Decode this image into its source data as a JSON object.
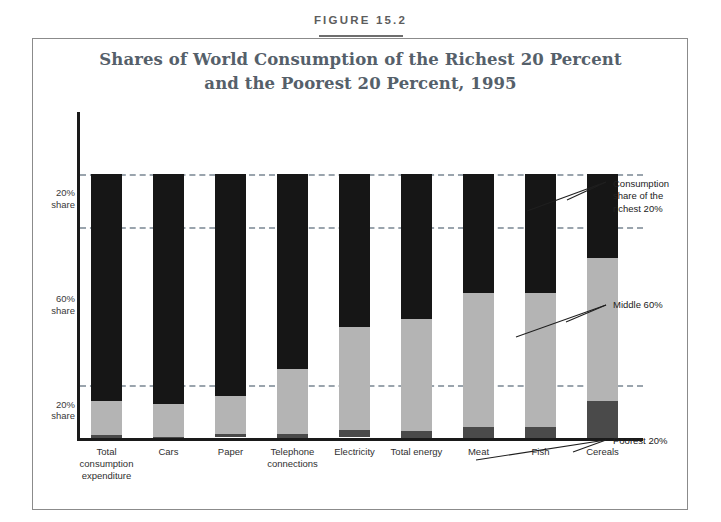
{
  "figure": {
    "number": "FIGURE 15.2",
    "title_line1": "Shares of World Consumption of the Richest 20 Percent",
    "title_line2": "and the Poorest 20 Percent, 1995"
  },
  "axis": {
    "y_labels": [
      {
        "pct": "20%",
        "word": "share"
      },
      {
        "pct": "60%",
        "word": "share"
      },
      {
        "pct": "20%",
        "word": "share"
      }
    ]
  },
  "callouts": {
    "richest": "Consumption share of the richest 20%",
    "middle": "Middle 60%",
    "poorest": "Poorest 20%"
  },
  "colors": {
    "richest": "#161616",
    "middle": "#b4b4b4",
    "poorest": "#4a4a4a",
    "title": "#55606a",
    "figure_number": "#5d5d5d",
    "gridline": "#9aa4ad",
    "axis": "#1a1a1a",
    "frame": "#8b8b8b"
  },
  "chart_data": {
    "type": "bar",
    "title": "Shares of World Consumption of the Richest 20 Percent and the Poorest 20 Percent, 1995",
    "xlabel": "",
    "ylabel": "Share of world consumption (%)",
    "ylim": [
      0,
      100
    ],
    "grid": true,
    "stacked": true,
    "legend_position": "annotations-right",
    "categories": [
      "Total consumption expenditure",
      "Cars",
      "Paper",
      "Telephone connections",
      "Electricity",
      "Total energy",
      "Meat",
      "Fish",
      "Cereals"
    ],
    "category_label_lines": [
      [
        "Total",
        "consumption",
        "expenditure"
      ],
      [
        "Cars"
      ],
      [
        "Paper"
      ],
      [
        "Telephone",
        "connections"
      ],
      [
        "Electricity"
      ],
      [
        "Total energy"
      ],
      [
        "Meat"
      ],
      [
        "Fish"
      ],
      [
        "Cereals"
      ]
    ],
    "series": [
      {
        "name": "Consumption share of the richest 20%",
        "color": "#161616",
        "values": [
          86,
          87,
          84,
          74,
          58,
          55,
          45,
          45,
          32
        ]
      },
      {
        "name": "Middle 60%",
        "color": "#b4b4b4",
        "values": [
          12.7,
          12.7,
          14.5,
          24.5,
          39,
          42.5,
          51,
          51,
          54
        ]
      },
      {
        "name": "Poorest 20%",
        "color": "#4a4a4a",
        "values": [
          1.3,
          0.3,
          1.1,
          1.5,
          2.5,
          2.5,
          4,
          4,
          14
        ]
      }
    ],
    "gridline_values": [
      100,
      80,
      20
    ]
  }
}
